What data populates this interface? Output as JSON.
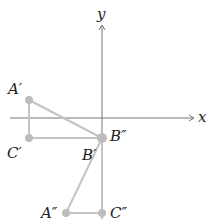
{
  "axes": {
    "x_label": "x",
    "y_label": "y",
    "axis_color": "#777777"
  },
  "shape_color": "#bdbdbd",
  "points": [
    {
      "id": "A1",
      "label": "A′",
      "x": 29,
      "y": 100
    },
    {
      "id": "C1",
      "label": "C′",
      "x": 29,
      "y": 138
    },
    {
      "id": "B",
      "label_upper": "B″",
      "label_lower": "B′",
      "x": 102,
      "y": 138
    },
    {
      "id": "A2",
      "label": "A″",
      "x": 66,
      "y": 213
    },
    {
      "id": "C2",
      "label": "C″",
      "x": 102,
      "y": 213
    }
  ],
  "labels": {
    "a_prime": "A′",
    "c_prime": "C′",
    "b_prime": "B′",
    "b_double_prime": "B″",
    "a_double_prime": "A″",
    "c_double_prime": "C″"
  }
}
